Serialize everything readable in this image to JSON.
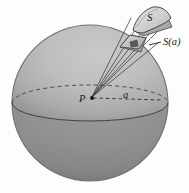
{
  "figure": {
    "background_color": "#fdfdfd",
    "labels": {
      "patch_outer": "S",
      "patch_inner": "S(a)",
      "center_point": "P",
      "radius_segment": "a"
    },
    "colors": {
      "sphere_light": "#c4c4c4",
      "sphere_mid": "#b0b0b0",
      "sphere_dark": "#8c8c8c",
      "sphere_lower": "#8a8a8a",
      "outline": "#4a4a4a",
      "ray_line": "#3d3d3d",
      "patch_fill_light": "#d8d8d8",
      "patch_fill_mid": "#bdbdbd",
      "label_color": "#1a1a1a"
    },
    "geometry": {
      "sphere_center_x": 90,
      "sphere_center_y": 103,
      "sphere_radius": 78,
      "equator_ry": 18,
      "point_p_x": 92,
      "point_p_y": 98,
      "radius_label_x": 126,
      "radius_label_y": 97
    },
    "elements": {
      "sphere_name": "sphere-body",
      "equator_back_name": "equator-dashed-back-arc",
      "equator_front_name": "equator-solid-front-arc",
      "cone_name": "ray-cone",
      "patch_outer_name": "surface-patch-S",
      "patch_inner_name": "surface-patch-S-of-a",
      "leader_name": "leader-line-S-of-a",
      "radius_line_name": "radius-dashed-line"
    }
  }
}
